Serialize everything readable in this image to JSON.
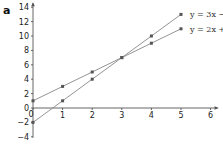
{
  "panel_label": "a",
  "chart_data": {
    "type": "line",
    "title": "",
    "xlabel": "",
    "ylabel": "",
    "xlim": [
      0,
      6
    ],
    "ylim": [
      -4,
      14
    ],
    "x_ticks": [
      0,
      1,
      2,
      3,
      4,
      5,
      6
    ],
    "y_ticks": [
      -4,
      -2,
      0,
      2,
      4,
      6,
      8,
      10,
      12,
      14
    ],
    "grid": false,
    "legend_position": "inline-right",
    "series": [
      {
        "name": "y = 3x − 2",
        "label_visible": "y = 3x − 2",
        "x": [
          0,
          1,
          2,
          3,
          4,
          5
        ],
        "values": [
          -2,
          1,
          4,
          7,
          10,
          13
        ],
        "color": "#888888"
      },
      {
        "name": "y = 2x + 1",
        "label_visible": "y = 2x +",
        "x": [
          0,
          1,
          2,
          3,
          4,
          5
        ],
        "values": [
          1,
          3,
          5,
          7,
          9,
          11
        ],
        "color": "#888888"
      }
    ],
    "annotations": [
      "intersection at (3, 7)"
    ]
  },
  "axis_color": "#555555",
  "marker_color": "#555555"
}
